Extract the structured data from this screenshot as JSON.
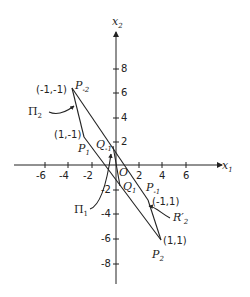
{
  "axes": {
    "x_label": "x",
    "x_sub": "1",
    "y_label": "x",
    "y_sub": "2",
    "x_ticks": [
      "-6",
      "-4",
      "-2",
      "2",
      "4",
      "6"
    ],
    "y_ticks_pos": [
      "8",
      "6",
      "4",
      "2"
    ],
    "y_ticks_neg": [
      "-2",
      "-4",
      "-6",
      "-8"
    ],
    "origin": "O"
  },
  "points": {
    "p_minus2": {
      "name": "P",
      "sub": "-2",
      "coord": "(-1,-1)"
    },
    "p_1": {
      "name": "P",
      "sub": "1",
      "coord": "(1,-1)"
    },
    "p_minus1": {
      "name": "P",
      "sub": "-1",
      "coord": "(-1,1)"
    },
    "p_2": {
      "name": "P",
      "sub": "2",
      "coord": "(1,1)"
    },
    "q_minus1": {
      "name": "Q",
      "sub": "-1"
    },
    "q_1": {
      "name": "Q",
      "sub": "1"
    }
  },
  "regions": {
    "pi_2": {
      "name": "Π",
      "sub": "2"
    },
    "pi_1": {
      "name": "Π",
      "sub": "1"
    },
    "r_2_prime": {
      "name": "R′",
      "sub": "2"
    }
  }
}
